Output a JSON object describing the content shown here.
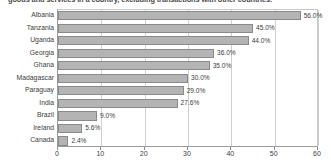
{
  "caption": {
    "text": "goods and services in a country, excluding transactions with other countries."
  },
  "chart_data": {
    "type": "bar",
    "orientation": "horizontal",
    "title": "",
    "subtitle": "",
    "xlabel": "",
    "ylabel": "",
    "xlim": [
      0,
      60
    ],
    "ylim": null,
    "grid": true,
    "grid_axis": "x",
    "legend": false,
    "legend_position": "none",
    "categories": [
      "Albania",
      "Tanzania",
      "Uganda",
      "Georgia",
      "Ghana",
      "Madagascar",
      "Paraguay",
      "India",
      "Brazil",
      "Ireland",
      "Canada"
    ],
    "values": [
      56.0,
      45.0,
      44.0,
      36.0,
      35.0,
      30.0,
      29.0,
      27.6,
      9.0,
      5.6,
      2.4
    ],
    "data_labels": [
      "56.0%",
      "45.0%",
      "44.0%",
      "36.0%",
      "35.0%",
      "30.0%",
      "29.0%",
      "27.6%",
      "9.0%",
      "5.6%",
      "2.4%"
    ],
    "xticks": [
      0,
      10,
      20,
      30,
      40,
      50,
      60
    ],
    "xticklabels": [
      "0",
      "10",
      "20",
      "30",
      "40",
      "50",
      "60"
    ],
    "colors": {
      "bar_fill": "#b4b4b4",
      "bar_edge": "#8a8a8a",
      "grid": "#d0d0d0",
      "axis": "#8a8a8a",
      "text": "#3c3c3c",
      "background": "#ffffff"
    }
  }
}
